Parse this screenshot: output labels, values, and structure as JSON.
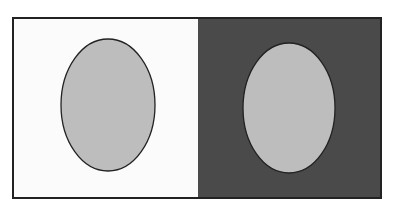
{
  "figure": {
    "colors": {
      "page_background": "#ffffff",
      "left_panel": "#fbfbfb",
      "right_panel": "#4a4a4a",
      "ellipse_fill": "#bdbdbd",
      "outline": "#222222"
    },
    "panels": [
      {
        "name": "light-panel",
        "x": 13,
        "y": 18,
        "width": 185,
        "height": 180
      },
      {
        "name": "dark-panel",
        "x": 198,
        "y": 18,
        "width": 183,
        "height": 180
      }
    ],
    "ellipses": [
      {
        "name": "left-gray-ellipse",
        "cx": 108,
        "cy": 105,
        "rx": 47,
        "ry": 66
      },
      {
        "name": "right-gray-ellipse",
        "cx": 289,
        "cy": 108,
        "rx": 46,
        "ry": 65
      }
    ]
  }
}
